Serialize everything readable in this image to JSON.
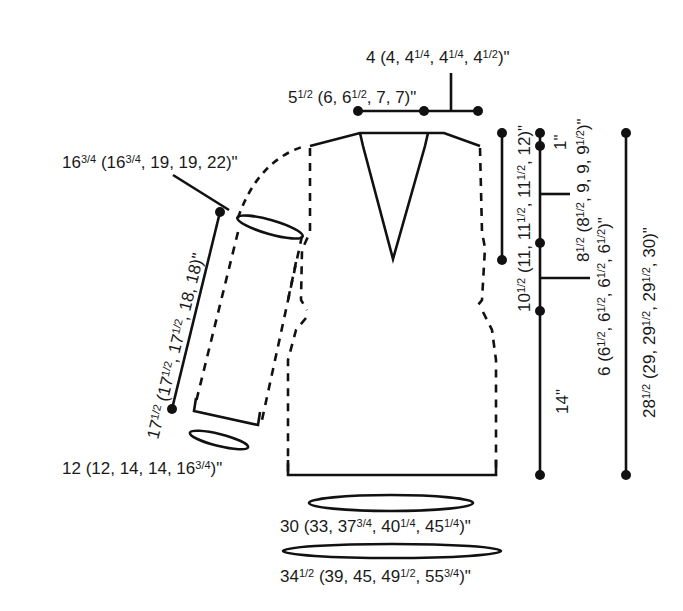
{
  "diagram": {
    "type": "knitting-schematic",
    "measurements": {
      "back_neck": "4 (4, 4¹/₄, 4¹/₄, 4¹/₂)\"",
      "shoulder": "5¹/₂ (6, 6¹/₂, 7, 7)\"",
      "upper_arm": "16³/₄ (16³/₄, 19, 19, 22)\"",
      "sleeve_length": "17¹/₂ (17¹/₂, 17¹/₂, 18, 18)\"",
      "cuff": "12 (12, 14, 14, 16³/₄)\"",
      "neck_depth": "10¹/₂ (11, 11¹/₂, 11¹/₂, 12)\"",
      "shoulder_slope": "1\"",
      "armhole_upper": "8¹/₂ (8¹/₂, 9, 9, 9¹/₂)\"",
      "armhole_lower": "6 (6¹/₂, 6¹/₂, 6¹/₂, 6¹/₂)\"",
      "body_to_armhole": "14\"",
      "total_length": "28¹/₂ (29, 29¹/₂, 29¹/₂, 30)\"",
      "hem_circumference": "30 (33, 37³/₄, 40¹/₄, 45¹/₄)\"",
      "chest_circumference": "34¹/₂ (39, 45, 49¹/₂, 55³/₄)\""
    }
  },
  "labels": {
    "back_neck": {
      "main": "4 (4, 4",
      "parts": [
        "4 (4, 4",
        "1/4",
        ", 4",
        "1/4",
        ", 4",
        "1/2",
        ")\""
      ]
    },
    "shoulder": {
      "parts": [
        "5",
        "1/2",
        " (6, 6",
        "1/2",
        ", 7, 7)\""
      ]
    },
    "upper_arm": {
      "parts": [
        "16",
        "3/4",
        " (16",
        "3/4",
        ", 19, 19, 22)\""
      ]
    },
    "sleeve_length": {
      "parts": [
        "17",
        "1/2",
        " (17",
        "1/2",
        ", 17",
        "1/2",
        ", 18, 18)\""
      ]
    },
    "cuff": {
      "parts": [
        "12 (12, 14, 14, 16",
        "3/4",
        ")\""
      ]
    },
    "neck_depth": {
      "parts": [
        "10",
        "1/2",
        " (11, 11",
        "1/2",
        ", 11",
        "1/2",
        ", 12)\""
      ]
    },
    "shoulder_slope": {
      "parts": [
        "1\""
      ]
    },
    "armhole_upper": {
      "parts": [
        "8",
        "1/2",
        " (8",
        "1/2",
        ", 9, 9, 9",
        "1/2",
        ")\""
      ]
    },
    "armhole_lower": {
      "parts": [
        "6 (6",
        "1/2",
        ", 6",
        "1/2",
        ", 6",
        "1/2",
        ", 6",
        "1/2",
        ")\""
      ]
    },
    "body_to_armhole": {
      "parts": [
        "14\""
      ]
    },
    "total_length": {
      "parts": [
        "28",
        "1/2",
        " (29, 29",
        "1/2",
        ", 29",
        "1/2",
        ", 30)\""
      ]
    },
    "hem": {
      "parts": [
        "30 (33, 37",
        "3/4",
        ", 40",
        "1/4",
        ", 45",
        "1/4",
        ")\""
      ]
    },
    "chest": {
      "parts": [
        "34",
        "1/2",
        " (39, 45, 49",
        "1/2",
        ", 55",
        "3/4",
        ")\""
      ]
    }
  }
}
